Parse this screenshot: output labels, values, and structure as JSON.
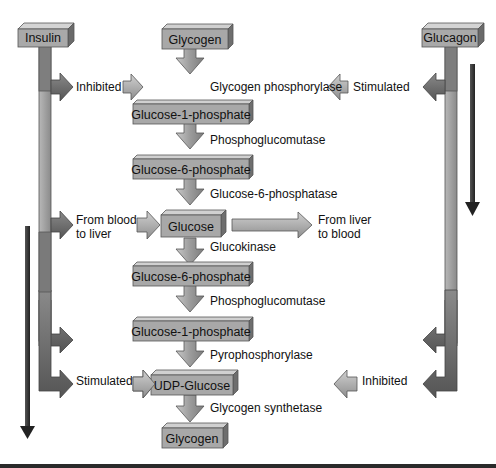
{
  "diagram": {
    "hormones": {
      "insulin": "Insulin",
      "glucagon": "Glucagon"
    },
    "pathway_boxes": [
      "Glycogen",
      "Glucose-1-phosphate",
      "Glucose-6-phosphate",
      "Glucose",
      "Glucose-6-phosphate",
      "Glucose-1-phosphate",
      "UDP-Glucose",
      "Glycogen"
    ],
    "enzymes": [
      "Glycogen phosphorylase",
      "Phosphoglucomutase",
      "Glucose-6-phosphatase",
      "Glucokinase",
      "Phosphoglucomutase",
      "Pyrophosphorylase",
      "Glycogen synthetase"
    ],
    "effects": {
      "insulin_top": "Inhibited",
      "insulin_bottom": "Stimulated",
      "glucagon_top": "Stimulated",
      "glucagon_bottom": "Inhibited"
    },
    "transport": {
      "blood_to_liver_line1": "From blood",
      "blood_to_liver_line2": "to liver",
      "liver_to_blood_line1": "From liver",
      "liver_to_blood_line2": "to blood"
    },
    "colors": {
      "box_fill": "#a8a8a8",
      "box_top": "#cfcfcf",
      "box_side": "#6e6e6e",
      "arrow_light": "#b8b8b8",
      "arrow_dark": "#6a6a6a",
      "indicator": "#3a3a3a"
    }
  }
}
